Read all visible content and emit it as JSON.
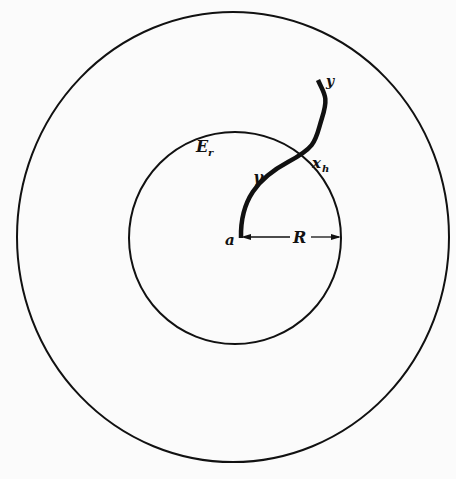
{
  "figure": {
    "background": "#fbfbfb",
    "ink": "#111111",
    "outer_circle": {
      "cx": 233,
      "cy": 237,
      "rx": 217,
      "ry": 225
    },
    "inner_circle": {
      "cx": 235,
      "cy": 238,
      "r": 107
    },
    "path_gamma": {
      "start_point": "a",
      "crossing_point": "x_h",
      "end_point": "y"
    },
    "labels": {
      "a": "a",
      "y": "y",
      "x_h_main": "x",
      "x_h_sub": "h",
      "gamma": "γ",
      "E_main": "E",
      "E_sub": "r",
      "radius": "R"
    }
  }
}
